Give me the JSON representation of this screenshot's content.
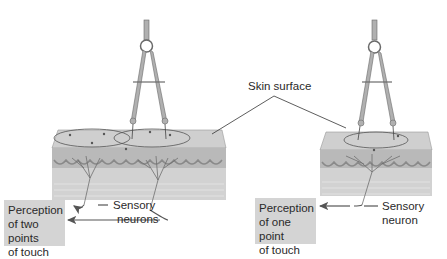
{
  "diagram": {
    "topic": "Two-point touch discrimination",
    "labels": {
      "skin_surface": "Skin surface",
      "sensory_neurons": [
        "Sensory",
        "neurons"
      ],
      "sensory_neuron": [
        "Sensory",
        "neuron"
      ]
    },
    "perception_boxes": {
      "left": [
        "Perception",
        "of two points",
        "of touch"
      ],
      "right": [
        "Perception",
        "of one point",
        "of touch"
      ]
    },
    "colors": {
      "skin_top": "#cfcfcf",
      "skin_side": "#bdbdbd",
      "dermis": "#c8c8c8",
      "box_fill": "#d4d4d4",
      "line": "#3a3a3a",
      "compass": "#a9a9a9"
    }
  }
}
